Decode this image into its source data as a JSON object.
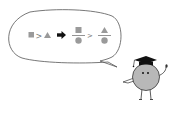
{
  "colors": {
    "shape_fill": "#9a9a9a",
    "outline": "#555555",
    "arrow": "#111111",
    "body_fill": "#b8b8b8",
    "cap": "#111111",
    "background": "#ffffff"
  },
  "bubble": {
    "expression": [
      {
        "type": "square",
        "label": "square"
      },
      {
        "type": "greater-than",
        "label": ">"
      },
      {
        "type": "triangle",
        "label": "triangle"
      },
      {
        "type": "arrow",
        "label": "implies"
      },
      {
        "type": "fraction",
        "numerator": "square",
        "denominator": "circle"
      },
      {
        "type": "greater-than",
        "label": ">"
      },
      {
        "type": "fraction",
        "numerator": "triangle",
        "denominator": "circle"
      }
    ],
    "gt_symbol": ">"
  },
  "character": {
    "description": "round grey character with graduation cap"
  }
}
